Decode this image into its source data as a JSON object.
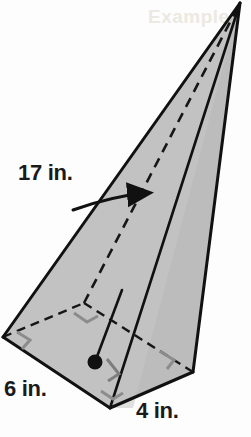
{
  "figure": {
    "kind": "rectangular-pyramid",
    "background_color": "#fdfdfd",
    "face_fill_light": "#c9c9c9",
    "face_fill_mid": "#bdbdbd",
    "face_fill_dark": "#b0b0b0",
    "base_fill": "#b5b5b5",
    "edge_color": "#111111",
    "hidden_edge_color": "#1a1a1a",
    "right_angle_color": "#8a8a8a",
    "center_dot_color": "#111111"
  },
  "labels": {
    "slant_height": "17 in.",
    "base_width": "6 in.",
    "base_depth": "4 in."
  },
  "ghost": {
    "top_bleed_text": "Example"
  },
  "geometry": {
    "apex": [
      240,
      3
    ],
    "base_left": [
      3,
      337
    ],
    "base_front": [
      110,
      408
    ],
    "base_right": [
      193,
      372
    ],
    "base_back": [
      84,
      303
    ],
    "base_center": [
      95,
      362
    ],
    "arrow_tip": [
      152,
      194
    ],
    "arrow_tail": [
      75,
      208
    ]
  },
  "annotations": {
    "right_angle_marks": 5,
    "center_dot": true,
    "hidden_edges_dashed": true,
    "arrow_to_slant_edge": true
  }
}
